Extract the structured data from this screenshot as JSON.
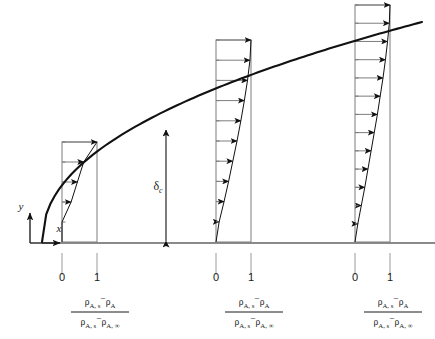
{
  "figure": {
    "background_color": "#ffffff",
    "line_color": "#1a1a1a",
    "thin_line_color": "#8a8a8a",
    "baseline": {
      "y": 243,
      "x_start": 42,
      "x_end": 435,
      "color": "#8a8a8a"
    },
    "axes": {
      "x_label": "x",
      "y_label": "y",
      "origin_x": 30,
      "origin_y": 243
    },
    "boundary_layer": {
      "label": "δ",
      "label_subscript": "c",
      "label_full": "δc",
      "arrow_x": 166,
      "arrow_top_y": 130,
      "arrow_bottom_y": 241,
      "curve_start": {
        "x": 42,
        "y": 242
      },
      "curve_end": {
        "x": 422,
        "y": 22
      }
    },
    "profiles": [
      {
        "name": "profile-1",
        "wall_x": 62,
        "unity_x": 97,
        "top_y": 142,
        "base_y": 242,
        "tick_labels": {
          "zero": "0",
          "one": "1"
        },
        "tick_zero_x": 62,
        "tick_one_x": 97,
        "tick_label_y": 281,
        "arrow_count": 5,
        "arrow_tips": [
          1.0,
          0.62,
          0.44,
          0.26,
          0.0
        ]
      },
      {
        "name": "profile-2",
        "wall_x": 216,
        "unity_x": 251,
        "top_y": 40,
        "base_y": 242,
        "tick_labels": {
          "zero": "0",
          "one": "1"
        },
        "tick_zero_x": 216,
        "tick_one_x": 251,
        "tick_label_y": 281,
        "arrow_count": 10,
        "arrow_tips": [
          1.0,
          0.97,
          0.9,
          0.81,
          0.71,
          0.6,
          0.48,
          0.36,
          0.23,
          0.09
        ]
      },
      {
        "name": "profile-3",
        "wall_x": 355,
        "unity_x": 390,
        "top_y": 5,
        "base_y": 242,
        "tick_labels": {
          "zero": "0",
          "one": "1"
        },
        "tick_zero_x": 355,
        "tick_one_x": 390,
        "tick_label_y": 281,
        "arrow_count": 13,
        "arrow_tips": [
          1.0,
          0.98,
          0.93,
          0.87,
          0.8,
          0.72,
          0.64,
          0.55,
          0.46,
          0.37,
          0.28,
          0.18,
          0.08
        ]
      }
    ],
    "formula": {
      "numerator": {
        "rho_1": "ρ",
        "sub_1": "A, s",
        "minus": "−",
        "rho_2": "ρ",
        "sub_2": "A"
      },
      "denominator": {
        "rho_1": "ρ",
        "sub_1": "A, s",
        "minus": "−",
        "rho_2": "ρ",
        "sub_2": "A, ∞"
      },
      "plain_text": "(ρA,s − ρA) / (ρA,s − ρA,∞)",
      "centers_x": [
        100,
        254,
        393
      ],
      "numerator_y": 305,
      "bar_y": 312,
      "denominator_y": 325
    }
  }
}
